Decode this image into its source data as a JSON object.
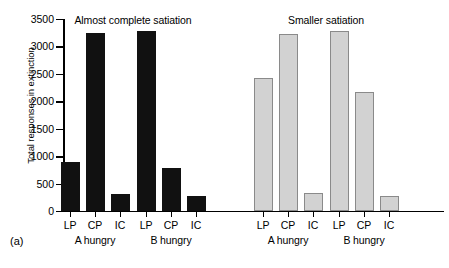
{
  "caption": "(a)",
  "chart_data": {
    "type": "bar",
    "title": "",
    "xlabel": "",
    "ylabel": "Total responses in extinction",
    "ylim": [
      0,
      3500
    ],
    "yticks": [
      0,
      500,
      1000,
      1500,
      2000,
      2500,
      3000,
      3500
    ],
    "ytick_labels": [
      "0",
      "500",
      "1000",
      "1500",
      "2000",
      "2500",
      "3000",
      "3500"
    ],
    "grid": false,
    "legend": "none",
    "categories": [
      "LP",
      "CP",
      "IC"
    ],
    "panels": [
      {
        "header": "Almost complete satiation",
        "fill": "#111111",
        "fill_name": "black",
        "groups": [
          {
            "name": "A hungry",
            "categories": [
              "LP",
              "CP",
              "IC"
            ],
            "values": [
              890,
              3240,
              310
            ]
          },
          {
            "name": "B hungry",
            "categories": [
              "LP",
              "CP",
              "IC"
            ],
            "values": [
              3290,
              780,
              280
            ]
          }
        ]
      },
      {
        "header": "Smaller satiation",
        "fill": "#d2d2d2",
        "fill_name": "grey",
        "groups": [
          {
            "name": "A hungry",
            "categories": [
              "LP",
              "CP",
              "IC"
            ],
            "values": [
              2430,
              3220,
              320
            ]
          },
          {
            "name": "B hungry",
            "categories": [
              "LP",
              "CP",
              "IC"
            ],
            "values": [
              3280,
              2170,
              280
            ]
          }
        ]
      }
    ]
  }
}
